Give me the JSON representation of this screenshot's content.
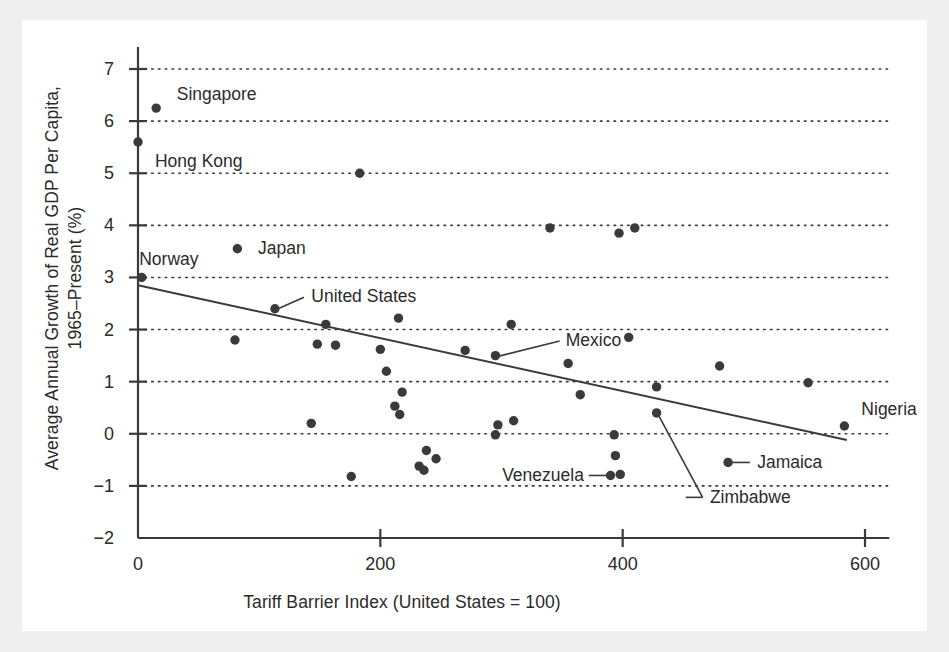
{
  "figure": {
    "background": "#ffffff",
    "page_background": "#efefef",
    "ink_color": "#3a3a3a",
    "text_color": "#2b2b2b"
  },
  "chart_data": {
    "type": "scatter",
    "title": "",
    "xlabel": "Tariff Barrier Index (United States = 100)",
    "ylabel": "Average Annual Growth of Real GDP Per Capita,\n1965–Present (%)",
    "xlim": [
      -20,
      620
    ],
    "ylim": [
      -2,
      7
    ],
    "xticks": [
      0,
      200,
      400,
      600
    ],
    "xtick_labels": [
      "0",
      "200",
      "400",
      "600"
    ],
    "yticks": [
      -2,
      -1,
      0,
      1,
      2,
      3,
      4,
      5,
      6,
      7
    ],
    "ytick_labels": [
      "−2",
      "−1",
      "0",
      "1",
      "2",
      "3",
      "4",
      "5",
      "6",
      "7"
    ],
    "grid": "horizontal-dotted",
    "legend": "none",
    "marker": {
      "shape": "circle",
      "size": 7,
      "color": "#3a3a3a"
    },
    "trendline": {
      "label": "regression line",
      "x_start": 0,
      "y_start": 2.85,
      "x_end": 585,
      "y_end": -0.12,
      "color": "#3a3a3a",
      "width": 2
    },
    "points": [
      {
        "x": 15,
        "y": 6.25,
        "label": "Singapore"
      },
      {
        "x": 0,
        "y": 5.6,
        "label": "Hong Kong"
      },
      {
        "x": 183,
        "y": 5.0,
        "label": ""
      },
      {
        "x": 340,
        "y": 3.95,
        "label": ""
      },
      {
        "x": 397,
        "y": 3.85,
        "label": ""
      },
      {
        "x": 410,
        "y": 3.95,
        "label": ""
      },
      {
        "x": 82,
        "y": 3.55,
        "label": "Japan"
      },
      {
        "x": 3,
        "y": 3.0,
        "label": "Norway"
      },
      {
        "x": 113,
        "y": 2.4,
        "label": "United States"
      },
      {
        "x": 215,
        "y": 2.22,
        "label": ""
      },
      {
        "x": 155,
        "y": 2.1,
        "label": ""
      },
      {
        "x": 308,
        "y": 2.1,
        "label": ""
      },
      {
        "x": 80,
        "y": 1.8,
        "label": ""
      },
      {
        "x": 148,
        "y": 1.72,
        "label": ""
      },
      {
        "x": 163,
        "y": 1.7,
        "label": ""
      },
      {
        "x": 200,
        "y": 1.62,
        "label": ""
      },
      {
        "x": 270,
        "y": 1.6,
        "label": ""
      },
      {
        "x": 295,
        "y": 1.5,
        "label": "Mexico"
      },
      {
        "x": 355,
        "y": 1.35,
        "label": ""
      },
      {
        "x": 405,
        "y": 1.85,
        "label": ""
      },
      {
        "x": 480,
        "y": 1.3,
        "label": ""
      },
      {
        "x": 205,
        "y": 1.2,
        "label": ""
      },
      {
        "x": 553,
        "y": 0.98,
        "label": ""
      },
      {
        "x": 428,
        "y": 0.9,
        "label": ""
      },
      {
        "x": 218,
        "y": 0.8,
        "label": ""
      },
      {
        "x": 365,
        "y": 0.75,
        "label": ""
      },
      {
        "x": 212,
        "y": 0.53,
        "label": ""
      },
      {
        "x": 216,
        "y": 0.37,
        "label": ""
      },
      {
        "x": 428,
        "y": 0.4,
        "label": "Zimbabwe"
      },
      {
        "x": 310,
        "y": 0.25,
        "label": ""
      },
      {
        "x": 143,
        "y": 0.2,
        "label": ""
      },
      {
        "x": 297,
        "y": 0.17,
        "label": ""
      },
      {
        "x": 583,
        "y": 0.15,
        "label": "Nigeria"
      },
      {
        "x": 295,
        "y": -0.02,
        "label": ""
      },
      {
        "x": 393,
        "y": -0.02,
        "label": ""
      },
      {
        "x": 238,
        "y": -0.32,
        "label": ""
      },
      {
        "x": 394,
        "y": -0.42,
        "label": ""
      },
      {
        "x": 246,
        "y": -0.48,
        "label": ""
      },
      {
        "x": 487,
        "y": -0.55,
        "label": "Jamaica"
      },
      {
        "x": 232,
        "y": -0.62,
        "label": ""
      },
      {
        "x": 236,
        "y": -0.7,
        "label": ""
      },
      {
        "x": 390,
        "y": -0.8,
        "label": "Venezuela"
      },
      {
        "x": 398,
        "y": -0.78,
        "label": ""
      },
      {
        "x": 176,
        "y": -0.82,
        "label": ""
      }
    ],
    "annotations": [
      {
        "text": "Singapore",
        "point_x": 15,
        "point_y": 6.25,
        "placement": "right"
      },
      {
        "text": "Hong Kong",
        "point_x": 0,
        "point_y": 5.6,
        "placement": "below-right"
      },
      {
        "text": "Japan",
        "point_x": 82,
        "point_y": 3.55,
        "placement": "right"
      },
      {
        "text": "Norway",
        "point_x": 3,
        "point_y": 3.0,
        "placement": "above-right"
      },
      {
        "text": "United States",
        "point_x": 113,
        "point_y": 2.4,
        "placement": "leader-right"
      },
      {
        "text": "Mexico",
        "point_x": 295,
        "point_y": 1.5,
        "placement": "leader-right"
      },
      {
        "text": "Venezuela",
        "point_x": 390,
        "point_y": -0.8,
        "placement": "leader-left"
      },
      {
        "text": "Zimbabwe",
        "point_x": 428,
        "point_y": 0.4,
        "placement": "leader-down-right"
      },
      {
        "text": "Jamaica",
        "point_x": 487,
        "point_y": -0.55,
        "placement": "leader-right"
      },
      {
        "text": "Nigeria",
        "point_x": 583,
        "point_y": 0.15,
        "placement": "above-left"
      }
    ]
  }
}
